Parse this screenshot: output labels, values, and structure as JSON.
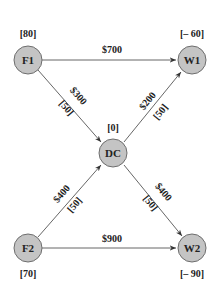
{
  "diagram": {
    "type": "network-flow",
    "nodes": [
      {
        "id": "F1",
        "label": "F1",
        "supply": "[80]",
        "cx": 28,
        "cy": 60
      },
      {
        "id": "W1",
        "label": "W1",
        "supply": "[– 60]",
        "cx": 192,
        "cy": 60
      },
      {
        "id": "DC",
        "label": "DC",
        "supply": "[0]",
        "cx": 113,
        "cy": 153
      },
      {
        "id": "F2",
        "label": "F2",
        "supply": "[70]",
        "cx": 28,
        "cy": 248
      },
      {
        "id": "W2",
        "label": "W2",
        "supply": "[– 90]",
        "cx": 192,
        "cy": 248
      }
    ],
    "edges": [
      {
        "from": "F1",
        "to": "W1",
        "cost": "$700",
        "capacity": null
      },
      {
        "from": "F1",
        "to": "DC",
        "cost": "$300",
        "capacity": "[50]"
      },
      {
        "from": "DC",
        "to": "W1",
        "cost": "$200",
        "capacity": "[50]"
      },
      {
        "from": "F2",
        "to": "DC",
        "cost": "$400",
        "capacity": "[50]"
      },
      {
        "from": "DC",
        "to": "W2",
        "cost": "$400",
        "capacity": "[50]"
      },
      {
        "from": "F2",
        "to": "W2",
        "cost": "$900",
        "capacity": null
      }
    ],
    "colors": {
      "node_fill": "#c4c4c4",
      "node_stroke": "#6e6e6e",
      "edge": "#555555",
      "text": "#222222"
    }
  }
}
